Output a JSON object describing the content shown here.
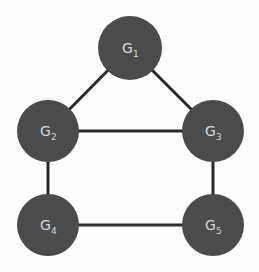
{
  "diagram": {
    "type": "graph",
    "nodes": [
      {
        "id": "G1",
        "base": "G",
        "sub": "1",
        "cx": 130,
        "cy": 48,
        "r": 32
      },
      {
        "id": "G2",
        "base": "G",
        "sub": "2",
        "cx": 48,
        "cy": 131,
        "r": 31
      },
      {
        "id": "G3",
        "base": "G",
        "sub": "3",
        "cx": 213,
        "cy": 131,
        "r": 31
      },
      {
        "id": "G4",
        "base": "G",
        "sub": "4",
        "cx": 48,
        "cy": 225,
        "r": 31
      },
      {
        "id": "G5",
        "base": "G",
        "sub": "5",
        "cx": 213,
        "cy": 225,
        "r": 31
      }
    ],
    "edges": [
      [
        "G1",
        "G2"
      ],
      [
        "G1",
        "G3"
      ],
      [
        "G2",
        "G3"
      ],
      [
        "G2",
        "G4"
      ],
      [
        "G3",
        "G5"
      ],
      [
        "G4",
        "G5"
      ]
    ],
    "colors": {
      "node_fill": "#4b4b4b",
      "edge": "#2b2b2b",
      "label": "#d8d8d8"
    }
  }
}
